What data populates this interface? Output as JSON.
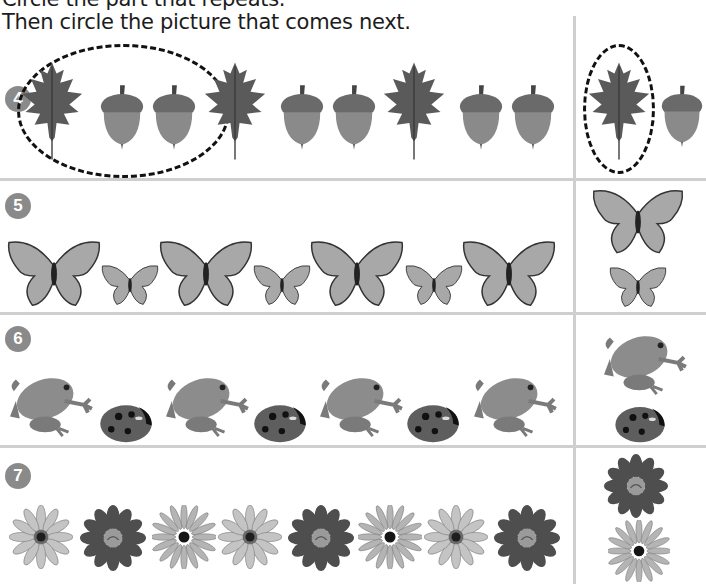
{
  "instructions": {
    "line1": "Circle the part that repeats.",
    "line2": "Then circle the picture that comes next."
  },
  "colors": {
    "divider": "#cfcfcf",
    "badge": "#8a8a8a",
    "ink": "#111111"
  },
  "problems": [
    {
      "number": "4",
      "sequence": [
        "leaf",
        "acorn",
        "acorn",
        "leaf",
        "acorn",
        "acorn",
        "leaf",
        "acorn",
        "acorn"
      ],
      "repeating_unit_circled": [
        "leaf",
        "acorn",
        "acorn"
      ],
      "choices": [
        "leaf",
        "acorn"
      ],
      "circled_choice": "leaf"
    },
    {
      "number": "5",
      "sequence": [
        "big butterfly",
        "small butterfly",
        "big butterfly",
        "small butterfly",
        "big butterfly",
        "small butterfly",
        "big butterfly"
      ],
      "choices": [
        "big butterfly",
        "small butterfly"
      ]
    },
    {
      "number": "6",
      "sequence": [
        "frog",
        "ladybug",
        "frog",
        "ladybug",
        "frog",
        "ladybug",
        "frog"
      ],
      "choices": [
        "frog",
        "ladybug"
      ]
    },
    {
      "number": "7",
      "sequence": [
        "light daisy",
        "dark gerbera",
        "thin daisy",
        "light daisy",
        "dark gerbera",
        "thin daisy",
        "light daisy",
        "dark gerbera"
      ],
      "choices": [
        "dark gerbera",
        "thin daisy"
      ]
    }
  ]
}
